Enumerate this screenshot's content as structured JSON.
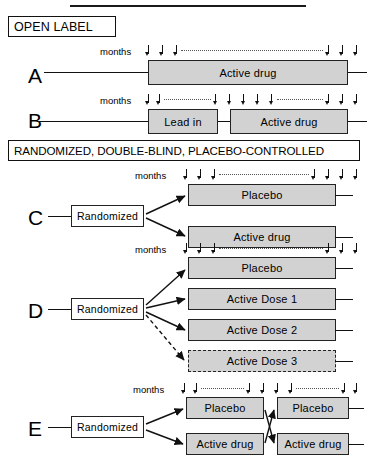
{
  "figure": {
    "title_rule": "horizontal-rule",
    "sections": [
      {
        "id": "open-label",
        "label": "OPEN LABEL"
      },
      {
        "id": "randomized",
        "label": "RANDOMIZED, DOUBLE-BLIND, PLACEBO-CONTROLLED"
      }
    ]
  },
  "months_label": "months",
  "arms": [
    {
      "letter": "A",
      "design": "open-label single arm",
      "ruler": "3 arrows, dotted interval, 3 arrows",
      "boxes": [
        {
          "label": "Active drug",
          "style": "filled"
        }
      ]
    },
    {
      "letter": "B",
      "design": "open-label lead-in then active",
      "ruler": "2 arrows, dots, 5 arrows, dots, 3 arrows",
      "boxes": [
        {
          "label": "Lead in",
          "style": "filled"
        },
        {
          "label": "Active drug",
          "style": "filled"
        }
      ]
    },
    {
      "letter": "C",
      "design": "randomized parallel two-arm",
      "randomize_label": "Randomized",
      "ruler": "3 arrows, dots, 4 arrows",
      "boxes": [
        {
          "label": "Placebo",
          "style": "filled"
        },
        {
          "label": "Active drug",
          "style": "filled"
        }
      ]
    },
    {
      "letter": "D",
      "design": "randomized dose-ranging four-arm",
      "randomize_label": "Randomized",
      "ruler": "3 arrows, dots, 3 arrows",
      "boxes": [
        {
          "label": "Placebo",
          "style": "filled"
        },
        {
          "label": "Active Dose 1",
          "style": "filled"
        },
        {
          "label": "Active Dose 2",
          "style": "filled"
        },
        {
          "label": "Active Dose 3",
          "style": "dashed"
        }
      ]
    },
    {
      "letter": "E",
      "design": "randomized crossover",
      "randomize_label": "Randomized",
      "ruler": "2 arrows, dots, 4 arrows, dots, 2 arrows",
      "boxes": [
        {
          "label": "Placebo",
          "style": "filled",
          "period": 1
        },
        {
          "label": "Active drug",
          "style": "filled",
          "period": 1
        },
        {
          "label": "Placebo",
          "style": "filled",
          "period": 2
        },
        {
          "label": "Active drug",
          "style": "filled",
          "period": 2
        }
      ]
    }
  ],
  "colors": {
    "box_fill": "#d2d2d2",
    "stroke": "#222222",
    "background": "#ffffff",
    "dotted": "#555555"
  }
}
